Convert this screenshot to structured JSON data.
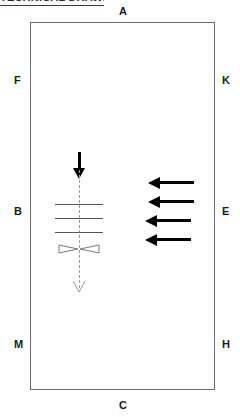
{
  "header": {
    "text": "TECHNICAL DRAWING",
    "truncated": true
  },
  "diagram": {
    "edge_labels": {
      "top": "A",
      "bottom": "C",
      "left_top": "F",
      "left_middle": "B",
      "left_bottom": "M",
      "right_top": "K",
      "right_middle": "E",
      "right_bottom": "H"
    },
    "colors": {
      "outline": "#6e6e6e",
      "label": "#1a1a1a",
      "arrow_solid": "#000000",
      "centerline": "#9a9a9a",
      "tick": "#555555",
      "hollow_arrow": "#9a9a9a"
    },
    "centerline": {
      "name": "vertical-dashed-centerline",
      "style": "dashed",
      "x": 79,
      "top": 152,
      "bottom": 294,
      "top_marker": "solid-down-arrow",
      "bottom_marker": "hollow-arrowhead"
    },
    "tick_lines": [
      {
        "x": 55,
        "y": 204,
        "width": 48
      },
      {
        "x": 55,
        "y": 218,
        "width": 48
      },
      {
        "x": 55,
        "y": 232,
        "width": 48
      }
    ],
    "bowtie": {
      "name": "bowtie-symbol",
      "x": 58,
      "y": 241,
      "width": 42,
      "height": 12
    },
    "left_arrows": [
      {
        "x": 148,
        "y": 177
      },
      {
        "x": 148,
        "y": 196
      },
      {
        "x": 145,
        "y": 215
      },
      {
        "x": 145,
        "y": 234
      }
    ]
  }
}
